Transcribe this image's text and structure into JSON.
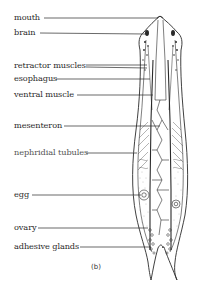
{
  "figure": {
    "caption": "(b)",
    "labels": [
      {
        "text": "mouth",
        "x": 14,
        "y": 12,
        "line_y": 18,
        "line_from": 44,
        "line_to": 158
      },
      {
        "text": "brain",
        "x": 14,
        "y": 27,
        "line_y": 33,
        "line_from": 40,
        "line_to": 146
      },
      {
        "text": "retractor muscles",
        "x": 14,
        "y": 60,
        "line_y": 66,
        "line_from": 86,
        "line_to": 147
      },
      {
        "text": "esophagus",
        "x": 14,
        "y": 73,
        "line_y": 79,
        "line_from": 56,
        "line_to": 150
      },
      {
        "text": "ventral muscle",
        "x": 14,
        "y": 88,
        "line_y": 95,
        "line_from": 77,
        "line_to": 153
      },
      {
        "text": "mesenteron",
        "x": 14,
        "y": 120,
        "line_y": 126,
        "line_from": 64,
        "line_to": 160
      },
      {
        "text": "nephridial tubules",
        "x": 14,
        "y": 147,
        "line_y": 153,
        "line_from": 86,
        "line_to": 137
      },
      {
        "text": "egg",
        "x": 14,
        "y": 189,
        "line_y": 195,
        "line_from": 32,
        "line_to": 141
      },
      {
        "text": "ovary",
        "x": 14,
        "y": 222,
        "line_y": 228,
        "line_from": 38,
        "line_to": 148
      },
      {
        "text": "adhesive glands",
        "x": 14,
        "y": 241,
        "line_y": 247,
        "line_from": 80,
        "line_to": 151
      }
    ]
  },
  "colors": {
    "ink": "#2a2a2a",
    "stipple": "#8a8a8a",
    "background": "#ffffff"
  }
}
